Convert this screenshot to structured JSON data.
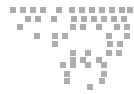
{
  "figure": {
    "name": "dotted-world-map",
    "width": 134,
    "height": 94,
    "background_color": "#ffffff",
    "dot_color": "#adadad",
    "dot_size": 6,
    "grid_pitch_x": 10,
    "grid_pitch_y": 8,
    "origin_x": 8,
    "origin_y": 6
  },
  "chart_data": {
    "type": "scatter",
    "xlabel": "",
    "ylabel": "",
    "grid": true,
    "legend": "none",
    "marker": "square",
    "marker_size": 6,
    "color": "#adadad",
    "xlim": [
      0,
      134
    ],
    "ylim": [
      0,
      94
    ],
    "points": [
      {
        "x": 10,
        "y": 7
      },
      {
        "x": 20,
        "y": 7
      },
      {
        "x": 30,
        "y": 7
      },
      {
        "x": 40,
        "y": 7
      },
      {
        "x": 56,
        "y": 7
      },
      {
        "x": 69,
        "y": 7
      },
      {
        "x": 79,
        "y": 7
      },
      {
        "x": 89,
        "y": 7
      },
      {
        "x": 99,
        "y": 7
      },
      {
        "x": 109,
        "y": 7
      },
      {
        "x": 119,
        "y": 7
      },
      {
        "x": 127,
        "y": 7
      },
      {
        "x": 25,
        "y": 16
      },
      {
        "x": 35,
        "y": 16
      },
      {
        "x": 51,
        "y": 16
      },
      {
        "x": 71,
        "y": 16
      },
      {
        "x": 81,
        "y": 16
      },
      {
        "x": 91,
        "y": 16
      },
      {
        "x": 101,
        "y": 16
      },
      {
        "x": 111,
        "y": 16
      },
      {
        "x": 121,
        "y": 16
      },
      {
        "x": 17,
        "y": 24
      },
      {
        "x": 70,
        "y": 24
      },
      {
        "x": 80,
        "y": 24
      },
      {
        "x": 96,
        "y": 24
      },
      {
        "x": 114,
        "y": 24
      },
      {
        "x": 124,
        "y": 24
      },
      {
        "x": 34,
        "y": 33
      },
      {
        "x": 52,
        "y": 33
      },
      {
        "x": 62,
        "y": 33
      },
      {
        "x": 106,
        "y": 33
      },
      {
        "x": 124,
        "y": 33
      },
      {
        "x": 52,
        "y": 41
      },
      {
        "x": 107,
        "y": 41
      },
      {
        "x": 117,
        "y": 41
      },
      {
        "x": 70,
        "y": 50
      },
      {
        "x": 85,
        "y": 50
      },
      {
        "x": 106,
        "y": 50
      },
      {
        "x": 116,
        "y": 50
      },
      {
        "x": 70,
        "y": 57
      },
      {
        "x": 80,
        "y": 57
      },
      {
        "x": 96,
        "y": 57
      },
      {
        "x": 60,
        "y": 62
      },
      {
        "x": 70,
        "y": 62
      },
      {
        "x": 85,
        "y": 62
      },
      {
        "x": 101,
        "y": 62
      },
      {
        "x": 64,
        "y": 71
      },
      {
        "x": 101,
        "y": 71
      },
      {
        "x": 64,
        "y": 78
      },
      {
        "x": 99,
        "y": 78
      },
      {
        "x": 87,
        "y": 84
      }
    ]
  }
}
